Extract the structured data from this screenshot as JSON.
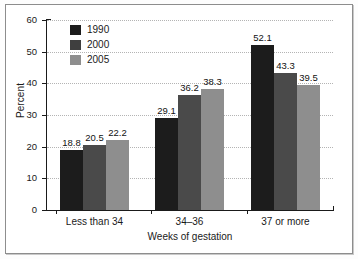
{
  "chart_data": {
    "type": "bar",
    "title": "",
    "xlabel": "Weeks of gestation",
    "ylabel": "Percent",
    "categories": [
      "Less than 34",
      "34–36",
      "37 or more"
    ],
    "series": [
      {
        "name": "1990",
        "color": "#1c1c1c",
        "values": [
          18.8,
          29.1,
          52.1
        ]
      },
      {
        "name": "2000",
        "color": "#4a4a4a",
        "values": [
          20.5,
          36.2,
          43.3
        ]
      },
      {
        "name": "2005",
        "color": "#8e8e8e",
        "values": [
          22.2,
          38.3,
          39.5
        ]
      }
    ],
    "ylim": [
      0,
      60
    ],
    "yticks": [
      0,
      10,
      20,
      30,
      40,
      50,
      60
    ],
    "ytick_labels": [
      "0",
      "10",
      "20",
      "30",
      "40",
      "50",
      "60"
    ],
    "grid": true,
    "grid_axis": "y",
    "legend_position": "upper-left-inside",
    "data_labels": [
      [
        "18.8",
        "20.5",
        "22.2"
      ],
      [
        "29.1",
        "36.2",
        "38.3"
      ],
      [
        "52.1",
        "43.3",
        "39.5"
      ]
    ]
  },
  "legend": {
    "entries": [
      {
        "label": "1990"
      },
      {
        "label": "2000"
      },
      {
        "label": "2005"
      }
    ]
  },
  "axes": {
    "y_title": "Percent",
    "x_title": "Weeks of gestation"
  }
}
